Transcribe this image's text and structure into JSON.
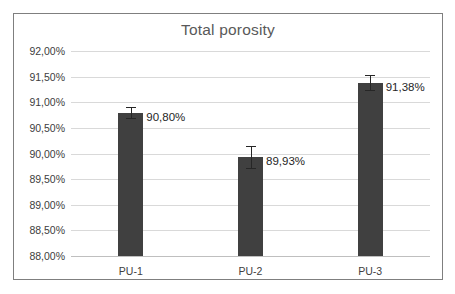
{
  "chart_data": {
    "type": "bar",
    "title": "Total porosity",
    "xlabel": "",
    "ylabel": "",
    "categories": [
      "PU-1",
      "PU-2",
      "PU-3"
    ],
    "values": [
      90.8,
      89.93,
      91.38
    ],
    "value_labels": [
      "90,80%",
      "89,93%",
      "91,38%"
    ],
    "errors": [
      0.1,
      0.21,
      0.145
    ],
    "ylim": [
      88.0,
      92.0
    ],
    "ytick_values": [
      88.0,
      88.5,
      89.0,
      89.5,
      90.0,
      90.5,
      91.0,
      91.5,
      92.0
    ],
    "ytick_labels": [
      "88,00%",
      "88,50%",
      "89,00%",
      "89,50%",
      "90,00%",
      "90,50%",
      "91,00%",
      "91,50%",
      "92,00%"
    ],
    "grid": true,
    "legend": false,
    "bar_color": "#404040",
    "grid_color": "#d9d9d9",
    "title_color": "#595959",
    "error_bar_color": "#262626"
  }
}
